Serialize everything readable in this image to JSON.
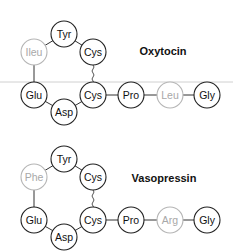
{
  "molecules": [
    {
      "name": "Oxytocin",
      "residues": [
        {
          "label": "Tyr",
          "highlight": false
        },
        {
          "label": "Ileu",
          "highlight": true
        },
        {
          "label": "Cys",
          "highlight": false
        },
        {
          "label": "Glu",
          "highlight": false
        },
        {
          "label": "Asp",
          "highlight": false
        },
        {
          "label": "Cys",
          "highlight": false
        },
        {
          "label": "Pro",
          "highlight": false
        },
        {
          "label": "Leu",
          "highlight": true
        },
        {
          "label": "Gly",
          "highlight": false
        }
      ]
    },
    {
      "name": "Vasopressin",
      "residues": [
        {
          "label": "Tyr",
          "highlight": false
        },
        {
          "label": "Phe",
          "highlight": true
        },
        {
          "label": "Cys",
          "highlight": false
        },
        {
          "label": "Glu",
          "highlight": false
        },
        {
          "label": "Asp",
          "highlight": false
        },
        {
          "label": "Cys",
          "highlight": false
        },
        {
          "label": "Pro",
          "highlight": false
        },
        {
          "label": "Arg",
          "highlight": true
        },
        {
          "label": "Gly",
          "highlight": false
        }
      ]
    }
  ],
  "colors": {
    "normal": "#222222",
    "highlight": "#b5b5b5"
  }
}
